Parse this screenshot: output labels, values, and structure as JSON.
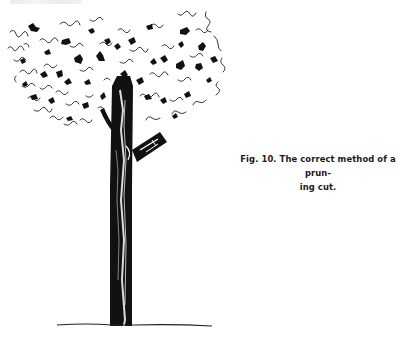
{
  "page": {
    "header_text_visible": false
  },
  "figure": {
    "number": "Fig. 10.",
    "ink_color": "#111111",
    "paper_color": "#ffffff"
  },
  "caption": {
    "line1": "Fig. 10. The correct method of a prun-",
    "line2": "ing cut."
  }
}
